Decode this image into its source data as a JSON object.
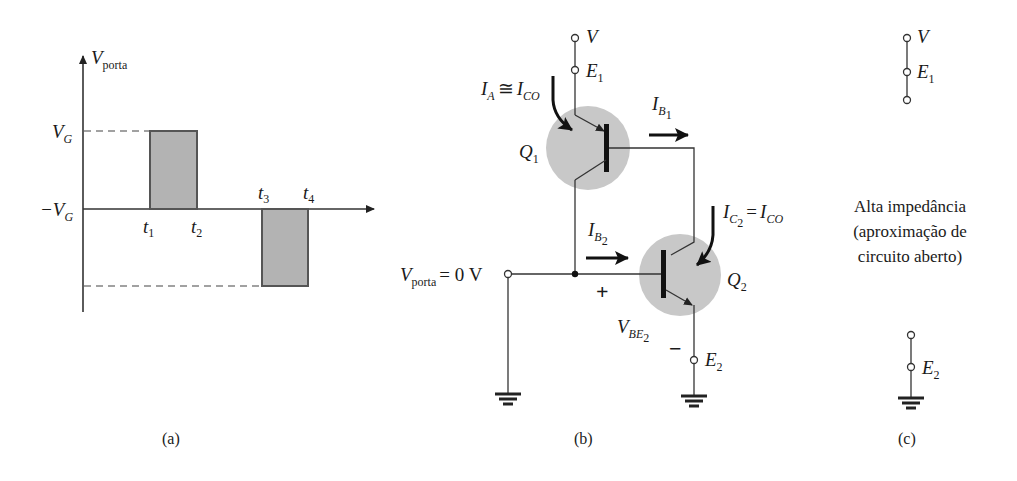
{
  "figure": {
    "panel_a": {
      "caption": "(a)",
      "y_axis_label_main": "V",
      "y_axis_label_sub": "porta",
      "level_high": {
        "main": "V",
        "sub": "G"
      },
      "level_low": {
        "main": "−V",
        "sub": "G"
      },
      "time_marks": [
        {
          "main": "t",
          "sub": "1"
        },
        {
          "main": "t",
          "sub": "2"
        },
        {
          "main": "t",
          "sub": "3"
        },
        {
          "main": "t",
          "sub": "4"
        }
      ]
    },
    "panel_b": {
      "caption": "(b)",
      "supply_terminal": "V",
      "emitter1_terminal": {
        "main": "E",
        "sub": "1"
      },
      "anode_current": {
        "text_a": "I",
        "sub_a": "A",
        "rel": "≅",
        "text_b": "I",
        "sub_b": "CO"
      },
      "transistor1": {
        "main": "Q",
        "sub": "1"
      },
      "base1_current": {
        "main": "I",
        "sub": "B",
        "subsub": "1"
      },
      "collector2_current": {
        "text_a": "I",
        "sub_a": "C",
        "subsub_a": "2",
        "rel": "=",
        "text_b": "I",
        "sub_b": "CO"
      },
      "base2_current": {
        "main": "I",
        "sub": "B",
        "subsub": "2"
      },
      "gate_input": {
        "main": "V",
        "sub": "porta",
        "value": "= 0 V"
      },
      "transistor2": {
        "main": "Q",
        "sub": "2"
      },
      "vbe2": {
        "main": "V",
        "sub": "BE",
        "subsub": "2"
      },
      "plus": "+",
      "minus": "−",
      "emitter2_terminal": {
        "main": "E",
        "sub": "2"
      }
    },
    "panel_c": {
      "caption": "(c)",
      "supply_terminal": "V",
      "emitter1_terminal": {
        "main": "E",
        "sub": "1"
      },
      "emitter2_terminal": {
        "main": "E",
        "sub": "2"
      },
      "note_lines": [
        "Alta impedância",
        "(aproximação de",
        "circuito aberto)"
      ]
    }
  },
  "colors": {
    "pulse_fill": "#b3b3b3",
    "transistor_halo": "#c8c8c8",
    "line": "#333333"
  }
}
